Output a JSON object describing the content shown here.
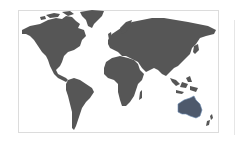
{
  "map": {
    "type": "world-map",
    "land_color": "#565656",
    "background_color": "#ffffff",
    "border_color": "#dcdcdc",
    "highlight": {
      "region": "Australia",
      "fill": "#4e596c",
      "outline": "#6f8fb5"
    },
    "regions": [
      {
        "id": "north-america",
        "label": "North America"
      },
      {
        "id": "greenland",
        "label": "Greenland"
      },
      {
        "id": "south-america",
        "label": "South America"
      },
      {
        "id": "europe-asia",
        "label": "Eurasia"
      },
      {
        "id": "africa",
        "label": "Africa"
      },
      {
        "id": "madagascar",
        "label": "Madagascar"
      },
      {
        "id": "southeast-asia-islands",
        "label": "Southeast Asia Islands"
      },
      {
        "id": "japan",
        "label": "Japan"
      },
      {
        "id": "uk",
        "label": "United Kingdom"
      },
      {
        "id": "australia",
        "label": "Australia"
      },
      {
        "id": "new-zealand",
        "label": "New Zealand"
      }
    ]
  }
}
